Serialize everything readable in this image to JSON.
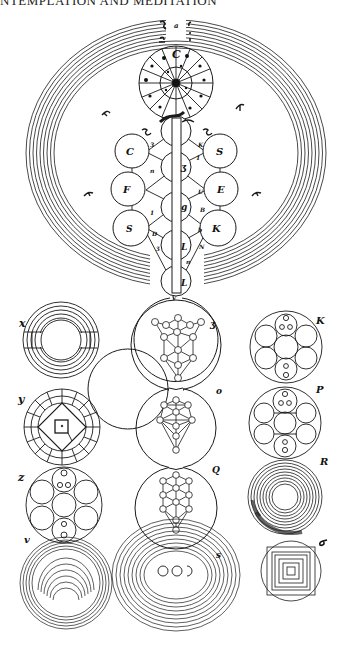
{
  "header": {
    "running_title": "NTEMPLATION AND MEDITATION"
  },
  "figure": {
    "main_diagram": {
      "name": "Tree of Life within concentric worlds",
      "top_label": "a",
      "wheel_labels": [
        "b"
      ],
      "side_labels": [
        "f",
        "f",
        "r",
        "r",
        "z",
        "z"
      ],
      "trunk_label": "v"
    },
    "sephiroth_labels": {
      "left": [
        "C",
        "F",
        "S"
      ],
      "right": [
        "S",
        "E",
        "K"
      ],
      "center": [
        "ʒ",
        "L"
      ]
    },
    "path_labels": [
      "3",
      "n",
      "1",
      "3",
      "1",
      "D",
      "Ʒ",
      "2",
      "1",
      "U",
      "B",
      "b",
      "N",
      "n"
    ],
    "sub_figures": {
      "left": [
        {
          "label": "x",
          "type": "concentric rings with horizontal band"
        },
        {
          "label": "y",
          "type": "segmented wheel with diamond and square"
        },
        {
          "label": "z",
          "type": "circle of seven circles"
        },
        {
          "label": "v",
          "type": "concentric rings"
        }
      ],
      "center": [
        {
          "label": "ʒ",
          "type": "tree of life in circle"
        },
        {
          "label": "o",
          "type": "tree of life in circle"
        },
        {
          "label": "Q",
          "type": "tree of life in circle"
        },
        {
          "label": "s",
          "type": "concentric rings with three circles"
        }
      ],
      "right": [
        {
          "label": "K",
          "type": "circle of seven circles"
        },
        {
          "label": "P",
          "type": "circle of seven circles"
        },
        {
          "label": "R",
          "type": "concentric rings"
        },
        {
          "label": "σ",
          "type": "nested squares in circle"
        }
      ]
    }
  }
}
